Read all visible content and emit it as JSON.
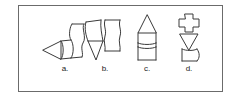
{
  "figure": {
    "border_color": "#6b6b6b",
    "background_color": "#ffffff",
    "line_color": "#3a3a3a",
    "items": [
      {
        "label": "a.",
        "name": "shape-a",
        "description": "horizontal cone pointing left joined to a short cylinder and a tall wavy-sided solid"
      },
      {
        "label": "b.",
        "name": "shape-b",
        "description": "curved-side quadrilateral above a downward pointing triangle beside a wavy-sided solid"
      },
      {
        "label": "c.",
        "name": "shape-c",
        "description": "cone on top of a cylinder divided by a narrow band"
      },
      {
        "label": "d.",
        "name": "shape-d",
        "description": "cross shape above an inverted triangle above a curved-side solid"
      }
    ]
  }
}
